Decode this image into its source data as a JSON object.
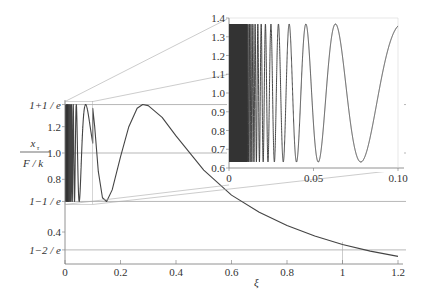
{
  "chart_data": [
    {
      "type": "line",
      "name": "main",
      "title": "",
      "xlabel": "ξ",
      "ylabel_num": "x_τ",
      "ylabel_den": "F / k",
      "xlim": [
        0,
        1.2
      ],
      "ylim": [
        0.17,
        1.4
      ],
      "x_ticks": [
        "0",
        "0.2",
        "0.4",
        "0.6",
        "0.8",
        "1",
        "1.2"
      ],
      "y_ticks": [
        {
          "value": 1.3679,
          "label": "1+1 / e"
        },
        {
          "value": 1.2,
          "label": "1.2"
        },
        {
          "value": 1.0,
          "label": "1.0"
        },
        {
          "value": 0.8,
          "label": "0.8"
        },
        {
          "value": 0.6321,
          "label": "1−1 / e"
        },
        {
          "value": 0.4,
          "label": "0.4"
        },
        {
          "value": 0.2642,
          "label": "1−2 / e"
        }
      ],
      "reference_lines": [
        1.3679,
        1.0,
        0.6321,
        0.2642
      ],
      "series": [
        {
          "name": "x_tau / (F/k)",
          "description": "rapid oscillation between 1−1/e and 1+1/e for small ξ, peak ≈1.368 at ξ≈0.28, then monotonic decay",
          "x": [
            0.1,
            0.12,
            0.15,
            0.2,
            0.25,
            0.28,
            0.3,
            0.4,
            0.5,
            0.6,
            0.7,
            0.8,
            0.9,
            1.0,
            1.1,
            1.2
          ],
          "y": [
            1.33,
            1.0,
            0.632,
            0.95,
            1.3,
            1.368,
            1.35,
            1.1,
            0.85,
            0.68,
            0.55,
            0.45,
            0.37,
            0.3,
            0.25,
            0.21
          ]
        }
      ],
      "grid": false
    },
    {
      "type": "line",
      "name": "inset",
      "title": "zoom of region 0 ≤ ξ ≤ 0.10",
      "xlim": [
        0,
        0.1
      ],
      "ylim": [
        0.6,
        1.4
      ],
      "x_ticks": [
        "0",
        "0.05",
        "0.10"
      ],
      "y_ticks": [
        "0.6",
        "0.7",
        "0.8",
        "0.9",
        "1.0",
        "1.1",
        "1.2",
        "1.3",
        "1.4"
      ],
      "series": [
        {
          "name": "x_tau / (F/k)",
          "description": "oscillation between 0.632 and 1.368 with increasing period; minima near ξ≈0.053 and ξ≈0.078, maximum near ξ≈0.063, ends ≈1.34 at ξ=0.10",
          "x": [
            0.045,
            0.053,
            0.063,
            0.078,
            0.1
          ],
          "y": [
            1.368,
            0.632,
            1.368,
            0.632,
            1.34
          ]
        }
      ],
      "grid": false
    }
  ]
}
